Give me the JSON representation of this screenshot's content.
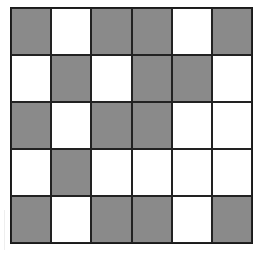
{
  "grid": {
    "rows": 5,
    "cols": 6,
    "colors": {
      "gray": "#8a8a8a",
      "white": "#ffffff",
      "border": "#222222"
    },
    "cells": [
      [
        "gray",
        "white",
        "gray",
        "gray",
        "white",
        "gray"
      ],
      [
        "white",
        "gray",
        "white",
        "gray",
        "gray",
        "white"
      ],
      [
        "gray",
        "white",
        "gray",
        "gray",
        "white",
        "white"
      ],
      [
        "white",
        "gray",
        "white",
        "white",
        "white",
        "white"
      ],
      [
        "gray",
        "white",
        "gray",
        "gray",
        "white",
        "gray"
      ]
    ]
  }
}
